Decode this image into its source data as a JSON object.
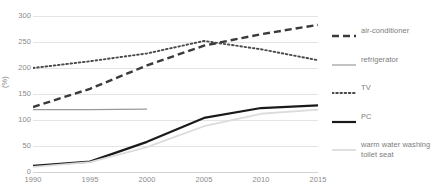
{
  "chart_data": {
    "type": "line",
    "title": "",
    "xlabel": "",
    "ylabel": "(%)",
    "x": [
      1990,
      1995,
      2000,
      2005,
      2010,
      2015
    ],
    "xlim": [
      1990,
      2015
    ],
    "ylim": [
      0,
      300
    ],
    "yticks": [
      0,
      50,
      100,
      150,
      200,
      250,
      300
    ],
    "xticks": [
      "1990",
      "1995",
      "2000",
      "2005",
      "2010",
      "2015"
    ],
    "grid": "horizontal",
    "legend_position": "right",
    "series": [
      {
        "name": "air-conditioner",
        "style": "dashed",
        "color": "#3a3a3a",
        "values": [
          125,
          160,
          205,
          243,
          265,
          283
        ]
      },
      {
        "name": "refrigerator",
        "style": "solid-thin",
        "color": "#9a9a9a",
        "values": [
          120,
          120,
          121,
          null,
          null,
          null
        ]
      },
      {
        "name": "TV",
        "style": "dotted",
        "color": "#4a4a4a",
        "values": [
          200,
          213,
          228,
          252,
          236,
          215
        ]
      },
      {
        "name": "PC",
        "style": "solid-thick",
        "color": "#1a1a1a",
        "values": [
          12,
          20,
          58,
          104,
          123,
          128
        ]
      },
      {
        "name": "warm water washing toilet seat",
        "style": "solid-light",
        "color": "#dcdcdc",
        "values": [
          10,
          19,
          48,
          88,
          112,
          120
        ]
      }
    ]
  },
  "y_axis": {
    "title": "(%)",
    "ticks": [
      "300",
      "250",
      "200",
      "150",
      "100",
      "50",
      "0"
    ]
  },
  "x_axis": {
    "ticks": [
      "1990",
      "1995",
      "2000",
      "2005",
      "2010",
      "2015"
    ]
  },
  "legend": {
    "items": [
      {
        "label": "air-conditioner"
      },
      {
        "label": "refrigerator"
      },
      {
        "label": "TV"
      },
      {
        "label": "PC"
      },
      {
        "label": "warm water washing toilet seat"
      }
    ]
  }
}
